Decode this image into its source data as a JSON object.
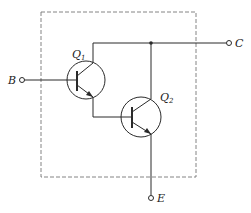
{
  "diagram": {
    "type": "darlington-pair-schematic",
    "colors": {
      "line": "#2a2a2a",
      "dash": "#777777",
      "background": "#ffffff"
    },
    "terminals": {
      "base": {
        "label": "B"
      },
      "collector": {
        "label": "C"
      },
      "emitter": {
        "label": "E"
      }
    },
    "transistors": [
      {
        "id": "Q1",
        "label": "Q",
        "subscript": "1"
      },
      {
        "id": "Q2",
        "label": "Q",
        "subscript": "2"
      }
    ]
  }
}
